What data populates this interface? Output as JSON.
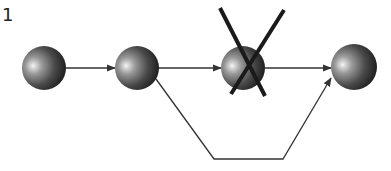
{
  "diagram": {
    "corner_label": "1",
    "type": "network-path-with-removed-node",
    "colors": {
      "background": "#ffffff",
      "edge": "#333333",
      "cross": "#1a1a1a",
      "sphere_highlight": "#f2f2f2",
      "sphere_mid": "#707070",
      "sphere_shadow": "#1c1c1c"
    },
    "nodes": [
      {
        "id": "n1",
        "cx": 44,
        "cy": 68,
        "r": 22,
        "removed": false
      },
      {
        "id": "n2",
        "cx": 137,
        "cy": 68,
        "r": 22,
        "removed": false
      },
      {
        "id": "n3",
        "cx": 243,
        "cy": 68,
        "r": 22,
        "removed": true
      },
      {
        "id": "n4",
        "cx": 354,
        "cy": 67,
        "r": 23,
        "removed": false
      }
    ],
    "edges": [
      {
        "from": "n1",
        "to": "n2",
        "points": [
          [
            66,
            68
          ],
          [
            115,
            68
          ]
        ]
      },
      {
        "from": "n2",
        "to": "n3",
        "points": [
          [
            159,
            68
          ],
          [
            221,
            68
          ]
        ]
      },
      {
        "from": "n3",
        "to": "n4",
        "points": [
          [
            265,
            68
          ],
          [
            331,
            68
          ]
        ]
      },
      {
        "from": "n2",
        "to": "n4",
        "label": "bypass",
        "points": [
          [
            156,
            79
          ],
          [
            214,
            159
          ],
          [
            283,
            159
          ],
          [
            331,
            78
          ]
        ]
      }
    ],
    "cross_mark": {
      "lines": [
        [
          [
            220,
            8
          ],
          [
            265,
            96
          ]
        ],
        [
          [
            284,
            10
          ],
          [
            231,
            94
          ]
        ]
      ],
      "stroke_width": 4
    }
  }
}
